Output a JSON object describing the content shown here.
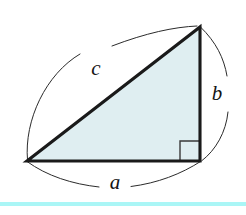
{
  "figure": {
    "type": "geometry-diagram",
    "background_color": "#ffffff",
    "triangle": {
      "fill_color": "#dfeef1",
      "edge_color": "#1a1a1a",
      "edge_width_px": 3.1,
      "vertices": {
        "bottom_left": {
          "x": 27,
          "y": 161
        },
        "bottom_right": {
          "x": 200,
          "y": 161
        },
        "apex": {
          "x": 200,
          "y": 27
        }
      },
      "right_angle_at": "bottom_right",
      "right_angle_marker": {
        "name": "right-angle-square",
        "size_px": 20,
        "color": "#3a3a3a"
      }
    },
    "labels": [
      {
        "id": "side-a",
        "text": "a",
        "x": 115,
        "y": 184,
        "describes": "base / horizontal leg",
        "style": "italic-serif"
      },
      {
        "id": "side-b",
        "text": "b",
        "x": 217,
        "y": 95,
        "describes": "vertical leg",
        "style": "italic-serif"
      },
      {
        "id": "side-c",
        "text": "c",
        "x": 96,
        "y": 70,
        "describes": "hypotenuse",
        "style": "italic-serif"
      }
    ],
    "arcs": [
      {
        "id": "arc-a",
        "for_label": "a",
        "bows": "downward-below-base",
        "color": "#2b2b2b",
        "stroke_width_px": 1.0,
        "broken_for_label": true
      },
      {
        "id": "arc-b",
        "for_label": "b",
        "bows": "rightward-outside-vertical-leg",
        "color": "#2b2b2b",
        "stroke_width_px": 1.0,
        "broken_for_label": true
      },
      {
        "id": "arc-c",
        "for_label": "c",
        "bows": "upward-left-outside-hypotenuse",
        "color": "#2b2b2b",
        "stroke_width_px": 1.0,
        "broken_for_label": true
      }
    ],
    "bottom_rule": {
      "name": "cyan-divider",
      "color": "#aaf6f6",
      "y": 202,
      "height_px": 4
    }
  }
}
